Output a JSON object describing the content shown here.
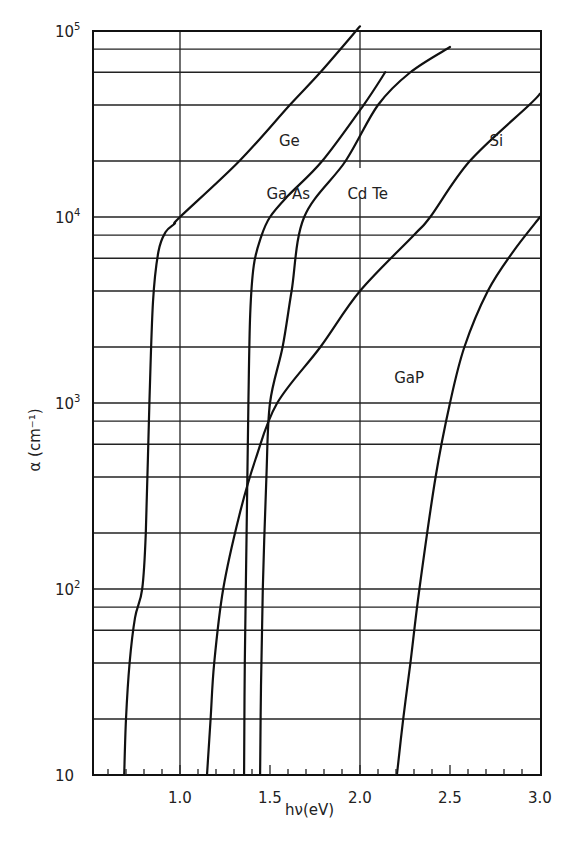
{
  "chart_data": {
    "type": "line",
    "title": "",
    "xlabel": "hν(eV)",
    "ylabel": "α (cm⁻¹)",
    "xscale": "linear",
    "yscale": "log",
    "xlim": [
      0.517,
      3.0
    ],
    "ylim": [
      10,
      100000
    ],
    "x_ticks": [
      {
        "value": 1.0,
        "label": "1.0"
      },
      {
        "value": 1.5,
        "label": "1.5"
      },
      {
        "value": 2.0,
        "label": "2.0"
      },
      {
        "value": 2.5,
        "label": "2.5"
      },
      {
        "value": 3.0,
        "label": "3.0"
      }
    ],
    "x_minor_step": 0.1,
    "x_grid_lines": [
      1.0,
      2.0
    ],
    "y_ticks": [
      {
        "value": 10,
        "label": "10",
        "exp": ""
      },
      {
        "value": 100,
        "label": "10",
        "exp": "2"
      },
      {
        "value": 1000,
        "label": "10",
        "exp": "3"
      },
      {
        "value": 10000,
        "label": "10",
        "exp": "4"
      },
      {
        "value": 100000,
        "label": "10",
        "exp": "5"
      }
    ],
    "y_grid_mantissas": [
      1,
      2,
      4,
      6,
      8
    ],
    "grid": true,
    "legend": "inline labels",
    "series": [
      {
        "name": "Ge",
        "label_pos": [
          1.55,
          24000
        ],
        "x": [
          0.69,
          0.7,
          0.72,
          0.75,
          0.79,
          0.81,
          0.83,
          0.85,
          0.88,
          0.92,
          0.97,
          1.0,
          1.33,
          1.61,
          1.78,
          2.0
        ],
        "y": [
          10,
          20,
          40,
          70,
          100,
          200,
          1000,
          3500,
          6500,
          8300,
          9200,
          10000,
          20000,
          40000,
          60000,
          106000
        ]
      },
      {
        "name": "GaAs",
        "label_pos": [
          1.48,
          12500
        ],
        "x": [
          1.356,
          1.36,
          1.37,
          1.38,
          1.39,
          1.41,
          1.45,
          1.5,
          1.6,
          1.79,
          2.02,
          2.14
        ],
        "y": [
          10,
          40,
          200,
          1000,
          3000,
          5500,
          7800,
          10000,
          13000,
          20000,
          40000,
          60000
        ]
      },
      {
        "name": "CdTe",
        "label_pos": [
          1.93,
          12500
        ],
        "x": [
          1.445,
          1.45,
          1.46,
          1.48,
          1.5,
          1.57,
          1.62,
          1.69,
          1.92,
          2.1,
          2.28,
          2.5
        ],
        "y": [
          10,
          30,
          100,
          400,
          1000,
          2000,
          4000,
          10000,
          20000,
          40000,
          60000,
          82000
        ]
      },
      {
        "name": "Si",
        "label_pos": [
          2.72,
          24000
        ],
        "x": [
          1.15,
          1.17,
          1.19,
          1.24,
          1.33,
          1.42,
          1.54,
          1.78,
          2.0,
          2.3,
          2.39,
          2.61,
          2.94,
          3.0
        ],
        "y": [
          10,
          20,
          40,
          100,
          250,
          500,
          1000,
          2000,
          4000,
          8000,
          10000,
          20000,
          40000,
          46000
        ]
      },
      {
        "name": "GaP",
        "label_pos": [
          2.19,
          1280
        ],
        "x": [
          2.205,
          2.24,
          2.28,
          2.33,
          2.42,
          2.5,
          2.58,
          2.71,
          2.85,
          3.0
        ],
        "y": [
          10,
          20,
          40,
          100,
          400,
          1000,
          2000,
          4000,
          6500,
          10000
        ]
      }
    ]
  }
}
